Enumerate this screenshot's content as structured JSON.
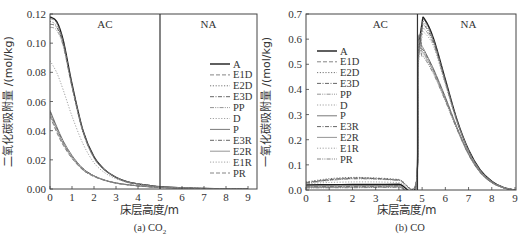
{
  "chart_data": [
    {
      "id": "left",
      "type": "line",
      "caption": "(a) CO",
      "caption_sub": "2",
      "xlabel": "床层高度/m",
      "ylabel": "二氧化碳吸附量 /(mol/kg)",
      "xlim": [
        0,
        9.4
      ],
      "ylim": [
        0,
        0.12
      ],
      "xticks": [
        0,
        1,
        2,
        3,
        4,
        5,
        6,
        7,
        8,
        9
      ],
      "yticks": [
        0.0,
        0.02,
        0.04,
        0.06,
        0.08,
        0.1,
        0.12
      ],
      "ytick_labels": [
        "0.00",
        "0.02",
        "0.04",
        "0.06",
        "0.08",
        "0.10",
        "0.12"
      ],
      "divider_x": 5,
      "regions": [
        {
          "label": "AC",
          "x": 2.5
        },
        {
          "label": "NA",
          "x": 7.2
        }
      ],
      "legend_position": "right-middle",
      "series": [
        {
          "name": "A",
          "style": "solid",
          "x": [
            0,
            0.3,
            0.6,
            1.0,
            1.5,
            2.0,
            2.5,
            3.0,
            3.5,
            4.0,
            4.5,
            5.0,
            6,
            7,
            8,
            9
          ],
          "values": [
            0.118,
            0.115,
            0.102,
            0.072,
            0.04,
            0.022,
            0.013,
            0.008,
            0.005,
            0.0035,
            0.0025,
            0.0015,
            0.0008,
            0.0004,
            0.0002,
            0.0001
          ]
        },
        {
          "name": "E1D",
          "style": "dash",
          "x": [
            0,
            0.3,
            0.6,
            1.0,
            1.5,
            2.0,
            2.5,
            3.0,
            3.5,
            4.0,
            4.5,
            5.0,
            6,
            7,
            8,
            9
          ],
          "values": [
            0.117,
            0.114,
            0.101,
            0.071,
            0.04,
            0.022,
            0.013,
            0.008,
            0.005,
            0.0035,
            0.0025,
            0.0015,
            0.0008,
            0.0004,
            0.0002,
            0.0001
          ]
        },
        {
          "name": "E2D",
          "style": "dot",
          "x": [
            0,
            0.3,
            0.6,
            1.0,
            1.5,
            2.0,
            2.5,
            3.0,
            3.5,
            4.0,
            4.5,
            5.0,
            6,
            7,
            8,
            9
          ],
          "values": [
            0.115,
            0.112,
            0.1,
            0.071,
            0.04,
            0.022,
            0.013,
            0.008,
            0.005,
            0.0035,
            0.0025,
            0.0015,
            0.0008,
            0.0004,
            0.0002,
            0.0001
          ]
        },
        {
          "name": "E3D",
          "style": "dashdot",
          "x": [
            0,
            0.3,
            0.6,
            1.0,
            1.5,
            2.0,
            2.5,
            3.0,
            3.5,
            4.0,
            4.5,
            5.0,
            6,
            7,
            8,
            9
          ],
          "values": [
            0.113,
            0.111,
            0.099,
            0.07,
            0.039,
            0.022,
            0.013,
            0.008,
            0.005,
            0.0035,
            0.0025,
            0.0015,
            0.0008,
            0.0004,
            0.0002,
            0.0001
          ]
        },
        {
          "name": "PP",
          "style": "dashdotdot",
          "x": [
            0,
            0.3,
            0.6,
            1.0,
            1.5,
            2.0,
            2.5,
            3.0,
            3.5,
            4.0,
            4.5,
            5.0,
            6,
            7,
            8,
            9
          ],
          "values": [
            0.111,
            0.109,
            0.098,
            0.07,
            0.039,
            0.021,
            0.013,
            0.008,
            0.005,
            0.0035,
            0.0025,
            0.0015,
            0.0008,
            0.0004,
            0.0002,
            0.0001
          ]
        },
        {
          "name": "D",
          "style": "dot",
          "x": [
            0,
            0.3,
            0.6,
            1.0,
            1.5,
            2.0,
            2.5,
            3.0,
            3.5,
            4.0,
            4.5,
            5.0,
            6,
            7,
            8,
            9
          ],
          "values": [
            0.088,
            0.08,
            0.068,
            0.05,
            0.031,
            0.018,
            0.011,
            0.007,
            0.0045,
            0.003,
            0.002,
            0.0013,
            0.0007,
            0.0004,
            0.0002,
            0.0001
          ]
        },
        {
          "name": "P",
          "style": "solid",
          "x": [
            0,
            0.3,
            0.6,
            1.0,
            1.5,
            2.0,
            2.5,
            3.0,
            3.5,
            4.0,
            4.5,
            5.0,
            6,
            7,
            8,
            9
          ],
          "values": [
            0.054,
            0.043,
            0.033,
            0.023,
            0.014,
            0.009,
            0.006,
            0.0042,
            0.003,
            0.0022,
            0.0016,
            0.0011,
            0.0006,
            0.0003,
            0.0002,
            0.0001
          ]
        },
        {
          "name": "E3R",
          "style": "dashdot",
          "x": [
            0,
            0.3,
            0.6,
            1.0,
            1.5,
            2.0,
            2.5,
            3.0,
            3.5,
            4.0,
            4.5,
            5.0,
            6,
            7,
            8,
            9
          ],
          "values": [
            0.053,
            0.042,
            0.032,
            0.022,
            0.014,
            0.009,
            0.006,
            0.0041,
            0.003,
            0.0022,
            0.0016,
            0.0011,
            0.0006,
            0.0003,
            0.0002,
            0.0001
          ]
        },
        {
          "name": "E2R",
          "style": "solid",
          "x": [
            0,
            0.3,
            0.6,
            1.0,
            1.5,
            2.0,
            2.5,
            3.0,
            3.5,
            4.0,
            4.5,
            5.0,
            6,
            7,
            8,
            9
          ],
          "values": [
            0.052,
            0.041,
            0.031,
            0.022,
            0.013,
            0.009,
            0.006,
            0.004,
            0.003,
            0.0021,
            0.0015,
            0.0011,
            0.0006,
            0.0003,
            0.0002,
            0.0001
          ]
        },
        {
          "name": "E1R",
          "style": "dot",
          "x": [
            0,
            0.3,
            0.6,
            1.0,
            1.5,
            2.0,
            2.5,
            3.0,
            3.5,
            4.0,
            4.5,
            5.0,
            6,
            7,
            8,
            9
          ],
          "values": [
            0.051,
            0.04,
            0.031,
            0.021,
            0.013,
            0.0085,
            0.0058,
            0.004,
            0.0029,
            0.0021,
            0.0015,
            0.001,
            0.0006,
            0.0003,
            0.0002,
            0.0001
          ]
        },
        {
          "name": "PR",
          "style": "dash",
          "x": [
            0,
            0.3,
            0.6,
            1.0,
            1.5,
            2.0,
            2.5,
            3.0,
            3.5,
            4.0,
            4.5,
            5.0,
            6,
            7,
            8,
            9
          ],
          "values": [
            0.05,
            0.039,
            0.03,
            0.021,
            0.013,
            0.0085,
            0.0058,
            0.004,
            0.0029,
            0.0021,
            0.0015,
            0.001,
            0.0006,
            0.0003,
            0.0002,
            0.0001
          ]
        }
      ]
    },
    {
      "id": "right",
      "type": "line",
      "caption": "(b) CO",
      "caption_sub": "",
      "xlabel": "床层高度/m",
      "ylabel": "一氧化碳吸附量 /(mol/kg)",
      "xlim": [
        0,
        9
      ],
      "ylim": [
        0,
        0.7
      ],
      "xticks": [
        0,
        1,
        2,
        3,
        4,
        5,
        6,
        7,
        8,
        9
      ],
      "yticks": [
        0.0,
        0.1,
        0.2,
        0.3,
        0.4,
        0.5,
        0.6,
        0.7
      ],
      "ytick_labels": [
        "0.0",
        "0.1",
        "0.2",
        "0.3",
        "0.4",
        "0.5",
        "0.6",
        "0.7"
      ],
      "divider_x": 4.8,
      "regions": [
        {
          "label": "AC",
          "x": 3.2
        },
        {
          "label": "NA",
          "x": 7.0
        }
      ],
      "legend_position": "left-middle",
      "series": [
        {
          "name": "A",
          "style": "solid",
          "x": [
            0,
            1,
            2,
            3,
            4,
            4.75,
            4.82,
            5.0,
            5.1,
            5.5,
            6.0,
            6.5,
            7.0,
            7.5,
            8.0,
            8.5,
            9.0
          ],
          "values": [
            0.02,
            0.021,
            0.022,
            0.022,
            0.023,
            0.025,
            0.5,
            0.665,
            0.68,
            0.6,
            0.44,
            0.28,
            0.16,
            0.08,
            0.035,
            0.01,
            0.0
          ]
        },
        {
          "name": "E1D",
          "style": "dash",
          "x": [
            0,
            1,
            2,
            3,
            4,
            4.75,
            4.82,
            5.0,
            5.1,
            5.5,
            6.0,
            6.5,
            7.0,
            7.5,
            8.0,
            8.5,
            9.0
          ],
          "values": [
            0.03,
            0.042,
            0.048,
            0.046,
            0.04,
            0.033,
            0.5,
            0.66,
            0.675,
            0.595,
            0.435,
            0.278,
            0.158,
            0.079,
            0.034,
            0.01,
            0.0
          ]
        },
        {
          "name": "E2D",
          "style": "dot",
          "x": [
            0,
            1,
            2,
            3,
            4,
            4.75,
            4.82,
            5.0,
            5.1,
            5.5,
            6.0,
            6.5,
            7.0,
            7.5,
            8.0,
            8.5,
            9.0
          ],
          "values": [
            0.032,
            0.045,
            0.05,
            0.048,
            0.042,
            0.034,
            0.49,
            0.65,
            0.665,
            0.59,
            0.432,
            0.276,
            0.157,
            0.078,
            0.034,
            0.01,
            0.0
          ]
        },
        {
          "name": "E3D",
          "style": "dashdot",
          "x": [
            0,
            1,
            2,
            3,
            4,
            4.75,
            4.82,
            5.0,
            5.1,
            5.5,
            6.0,
            6.5,
            7.0,
            7.5,
            8.0,
            8.5,
            9.0
          ],
          "values": [
            0.028,
            0.04,
            0.046,
            0.045,
            0.039,
            0.032,
            0.48,
            0.64,
            0.655,
            0.585,
            0.43,
            0.275,
            0.156,
            0.078,
            0.034,
            0.01,
            0.0
          ]
        },
        {
          "name": "PP",
          "style": "dashdotdot",
          "x": [
            0,
            1,
            2,
            3,
            4,
            4.75,
            4.82,
            5.0,
            5.1,
            5.5,
            6.0,
            6.5,
            7.0,
            7.5,
            8.0,
            8.5,
            9.0
          ],
          "values": [
            0.026,
            0.038,
            0.044,
            0.043,
            0.038,
            0.031,
            0.47,
            0.625,
            0.64,
            0.578,
            0.425,
            0.272,
            0.155,
            0.077,
            0.033,
            0.01,
            0.0
          ]
        },
        {
          "name": "D",
          "style": "dot",
          "x": [
            0,
            1,
            2,
            3,
            4,
            4.75,
            4.82,
            5.0,
            5.1,
            5.5,
            6.0,
            6.5,
            7.0,
            7.5,
            8.0,
            8.5,
            9.0
          ],
          "values": [
            0.025,
            0.03,
            0.032,
            0.032,
            0.03,
            0.028,
            0.46,
            0.61,
            0.625,
            0.57,
            0.42,
            0.27,
            0.154,
            0.077,
            0.033,
            0.01,
            0.0
          ]
        },
        {
          "name": "P",
          "style": "solid",
          "x": [
            0,
            1,
            2,
            3,
            4,
            4.75,
            4.82,
            5.0,
            5.1,
            5.5,
            6.0,
            6.5,
            7.0,
            7.5,
            8.0,
            8.5,
            9.0
          ],
          "values": [
            0.015,
            0.016,
            0.017,
            0.017,
            0.018,
            0.02,
            0.58,
            0.57,
            0.555,
            0.48,
            0.37,
            0.25,
            0.145,
            0.072,
            0.03,
            0.009,
            0.0
          ]
        },
        {
          "name": "E3R",
          "style": "dashdot",
          "x": [
            0,
            1,
            2,
            3,
            4,
            4.75,
            4.82,
            5.0,
            5.1,
            5.5,
            6.0,
            6.5,
            7.0,
            7.5,
            8.0,
            8.5,
            9.0
          ],
          "values": [
            0.012,
            0.013,
            0.014,
            0.014,
            0.015,
            0.017,
            0.57,
            0.56,
            0.548,
            0.475,
            0.365,
            0.247,
            0.143,
            0.071,
            0.03,
            0.009,
            0.0
          ]
        },
        {
          "name": "E2R",
          "style": "solid",
          "x": [
            0,
            1,
            2,
            3,
            4,
            4.75,
            4.82,
            5.0,
            5.1,
            5.5,
            6.0,
            6.5,
            7.0,
            7.5,
            8.0,
            8.5,
            9.0
          ],
          "values": [
            0.01,
            0.011,
            0.012,
            0.012,
            0.013,
            0.015,
            0.56,
            0.55,
            0.54,
            0.47,
            0.36,
            0.245,
            0.142,
            0.07,
            0.029,
            0.009,
            0.0
          ]
        },
        {
          "name": "E1R",
          "style": "dot",
          "x": [
            0,
            1,
            2,
            3,
            4,
            4.75,
            4.82,
            5.0,
            5.1,
            5.5,
            6.0,
            6.5,
            7.0,
            7.5,
            8.0,
            8.5,
            9.0
          ],
          "values": [
            0.009,
            0.01,
            0.01,
            0.011,
            0.012,
            0.014,
            0.55,
            0.54,
            0.532,
            0.465,
            0.357,
            0.243,
            0.141,
            0.07,
            0.029,
            0.009,
            0.0
          ]
        },
        {
          "name": "PR",
          "style": "dashdotdot",
          "x": [
            0,
            1,
            2,
            3,
            4,
            4.75,
            4.82,
            5.0,
            5.1,
            5.5,
            6.0,
            6.5,
            7.0,
            7.5,
            8.0,
            8.5,
            9.0
          ],
          "values": [
            0.008,
            0.009,
            0.009,
            0.01,
            0.011,
            0.013,
            0.54,
            0.53,
            0.525,
            0.46,
            0.354,
            0.241,
            0.14,
            0.069,
            0.029,
            0.009,
            0.0
          ]
        }
      ]
    }
  ]
}
